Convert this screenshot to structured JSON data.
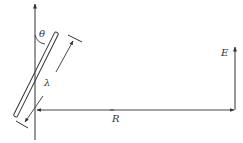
{
  "diagram": {
    "labels": {
      "theta": "θ",
      "lambda": "λ",
      "R": "R",
      "E": "E"
    },
    "colors": {
      "stroke": "#333333",
      "background": "#ffffff"
    }
  }
}
